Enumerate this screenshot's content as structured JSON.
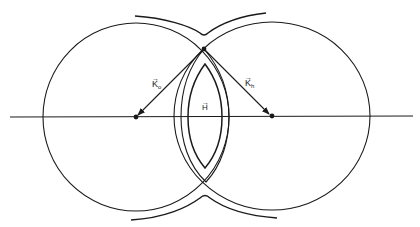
{
  "diagram": {
    "type": "ewald-sphere-construction",
    "stroke_color": "#1a1a1a",
    "background": "#ffffff",
    "labels": {
      "k0": {
        "text": "K",
        "subscript": "o",
        "vector_arrow": "→"
      },
      "kh": {
        "text": "K",
        "subscript": "h",
        "vector_arrow": "→"
      },
      "h": {
        "text": "H",
        "vector_arrow": "→"
      }
    },
    "elements": [
      "horizontal-axis",
      "left-sphere",
      "right-sphere",
      "upper-hyperbola-pair",
      "lower-hyperbola-pair",
      "inner-lens-ring",
      "wavevector-k0",
      "wavevector-kh",
      "tie-point"
    ]
  }
}
